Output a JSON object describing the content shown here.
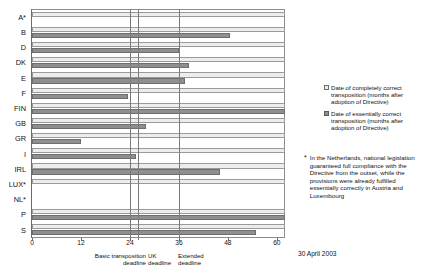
{
  "chart_data": {
    "type": "bar",
    "orientation": "horizontal",
    "title": "",
    "xlabel": "",
    "ylabel": "",
    "xlim": [
      0,
      62
    ],
    "xticks": [
      0,
      12,
      24,
      36,
      48,
      60
    ],
    "xtick_labels": [
      "0",
      "12",
      "24",
      "36",
      "48",
      "60"
    ],
    "grid": false,
    "legend_position": "right",
    "categories": [
      "A*",
      "B",
      "D",
      "DK",
      "E",
      "F",
      "FIN",
      "GB",
      "GR",
      "I",
      "IRL",
      "LUX*",
      "NL*",
      "P",
      "S"
    ],
    "series": [
      {
        "name": "Date of completely correct transposition (months after adoption of Directive)",
        "color": "#ededed",
        "values": [
          62,
          62,
          62,
          62,
          62,
          62,
          62,
          62,
          62,
          62,
          62,
          62,
          0,
          62,
          62
        ]
      },
      {
        "name": "Date of essentially correct transposition (months after adoption of Directive)",
        "color": "#8f8f8f",
        "values": [
          0,
          48.5,
          36,
          38.5,
          37.5,
          23.5,
          62,
          28,
          12,
          25.5,
          46,
          0,
          0,
          62,
          55
        ]
      }
    ],
    "annotations": [
      {
        "name": "basic-transposition-deadline",
        "x": 24,
        "label": "Basic transposition deadline"
      },
      {
        "name": "uk-deadline",
        "x": 26,
        "label": "UK deadline"
      },
      {
        "name": "extended-deadline",
        "x": 36,
        "label": "Extended deadline"
      }
    ]
  },
  "axis": {
    "ticks": [
      "0",
      "12",
      "24",
      "36",
      "48",
      "60"
    ]
  },
  "deadlines": {
    "basic_line1": "Basic transposition",
    "basic_line2": "deadline",
    "uk_line1": "UK",
    "uk_line2": "deadline",
    "extended_line1": "Extended",
    "extended_line2": "deadline"
  },
  "legend": {
    "items": [
      {
        "label": "Date of completely correct transposition (months after adoption of Directive)",
        "swatch": "light"
      },
      {
        "label": "Date of essentially correct transposition (months after adoption of Directive)",
        "swatch": "dark"
      }
    ]
  },
  "footnote": {
    "marker": "*",
    "text": "In the Netherlands, national legislation guaranteed full compliance with the Directive from the outset, while the provisions were already fulfilled essentially correctly in Austria and Luxembourg"
  },
  "date_stamp": "30 April 2003"
}
